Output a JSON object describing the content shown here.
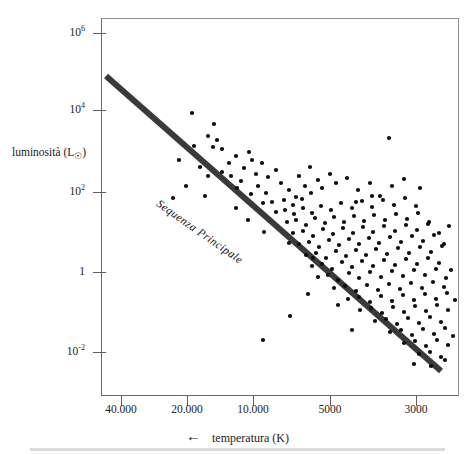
{
  "figure": {
    "kind": "hertzsprung-russell-diagram",
    "background_color": "#ffffff",
    "ink_color": "#111111"
  },
  "axes": {
    "y_title_text": "luminosità (L",
    "y_title_sun": "☉",
    "y_title_close": ")",
    "x_title": "temperatura (K)",
    "x_arrow": "←"
  },
  "annotations": {
    "main_sequence": "Sequenza Principale"
  },
  "chart_data": {
    "type": "scatter",
    "title": "",
    "xlabel": "temperatura (K)",
    "ylabel": "luminosità (L☉)",
    "xscale": "log-reversed",
    "yscale": "log",
    "xlim": [
      48000,
      2600
    ],
    "ylim": [
      0.001,
      4000000.0
    ],
    "grid": false,
    "legend": null,
    "x_ticks": [
      {
        "value": 40000,
        "label": "40.000",
        "px": 121
      },
      {
        "value": 20000,
        "label": "20.000",
        "px": 187
      },
      {
        "value": 10000,
        "label": "10.000",
        "px": 253
      },
      {
        "value": 5000,
        "label": "5000",
        "px": 330
      },
      {
        "value": 3000,
        "label": "3000",
        "px": 416
      }
    ],
    "y_ticks": [
      {
        "value": 1000000,
        "mantissa": "10",
        "exponent": "6",
        "label": "10^6",
        "px": 33
      },
      {
        "value": 10000,
        "mantissa": "10",
        "exponent": "4",
        "label": "10^4",
        "px": 110
      },
      {
        "value": 100,
        "mantissa": "10",
        "exponent": "2",
        "label": "10^2",
        "px": 192
      },
      {
        "value": 1,
        "mantissa": "1",
        "exponent": "",
        "label": "1",
        "px": 272
      },
      {
        "value": 0.01,
        "mantissa": "10",
        "exponent": "-2",
        "label": "10^-2",
        "px": 352
      }
    ],
    "main_sequence_line": {
      "label": "Sequenza Principale",
      "color": "#3a3a3a",
      "width_px": 6,
      "start_px": [
        106,
        76
      ],
      "end_px": [
        441,
        371
      ]
    },
    "points_px": [
      [
        192,
        113
      ],
      [
        214,
        124
      ],
      [
        208,
        136
      ],
      [
        217,
        140
      ],
      [
        194,
        146
      ],
      [
        213,
        147
      ],
      [
        222,
        149
      ],
      [
        179,
        160
      ],
      [
        236,
        156
      ],
      [
        229,
        163
      ],
      [
        249,
        152
      ],
      [
        252,
        160
      ],
      [
        200,
        167
      ],
      [
        244,
        168
      ],
      [
        262,
        163
      ],
      [
        222,
        172
      ],
      [
        208,
        176
      ],
      [
        231,
        176
      ],
      [
        256,
        174
      ],
      [
        241,
        181
      ],
      [
        268,
        177
      ],
      [
        276,
        170
      ],
      [
        237,
        188
      ],
      [
        258,
        186
      ],
      [
        281,
        183
      ],
      [
        299,
        176
      ],
      [
        310,
        167
      ],
      [
        389,
        138
      ],
      [
        251,
        194
      ],
      [
        266,
        193
      ],
      [
        289,
        190
      ],
      [
        296,
        197
      ],
      [
        305,
        186
      ],
      [
        318,
        180
      ],
      [
        330,
        174
      ],
      [
        263,
        203
      ],
      [
        272,
        202
      ],
      [
        284,
        200
      ],
      [
        293,
        205
      ],
      [
        302,
        199
      ],
      [
        311,
        193
      ],
      [
        322,
        188
      ],
      [
        336,
        183
      ],
      [
        347,
        178
      ],
      [
        358,
        190
      ],
      [
        370,
        183
      ],
      [
        380,
        196
      ],
      [
        392,
        186
      ],
      [
        404,
        179
      ],
      [
        276,
        212
      ],
      [
        285,
        210
      ],
      [
        294,
        214
      ],
      [
        303,
        208
      ],
      [
        312,
        213
      ],
      [
        321,
        206
      ],
      [
        331,
        210
      ],
      [
        341,
        203
      ],
      [
        352,
        208
      ],
      [
        362,
        201
      ],
      [
        372,
        207
      ],
      [
        383,
        200
      ],
      [
        394,
        205
      ],
      [
        405,
        198
      ],
      [
        416,
        206
      ],
      [
        287,
        222
      ],
      [
        296,
        220
      ],
      [
        306,
        225
      ],
      [
        315,
        218
      ],
      [
        325,
        223
      ],
      [
        334,
        217
      ],
      [
        344,
        222
      ],
      [
        354,
        216
      ],
      [
        364,
        221
      ],
      [
        374,
        215
      ],
      [
        385,
        220
      ],
      [
        396,
        214
      ],
      [
        407,
        219
      ],
      [
        418,
        213
      ],
      [
        429,
        222
      ],
      [
        293,
        233
      ],
      [
        303,
        231
      ],
      [
        313,
        236
      ],
      [
        323,
        229
      ],
      [
        333,
        234
      ],
      [
        343,
        228
      ],
      [
        353,
        233
      ],
      [
        363,
        227
      ],
      [
        373,
        232
      ],
      [
        384,
        226
      ],
      [
        395,
        231
      ],
      [
        406,
        225
      ],
      [
        417,
        230
      ],
      [
        428,
        224
      ],
      [
        439,
        233
      ],
      [
        299,
        244
      ],
      [
        309,
        242
      ],
      [
        319,
        247
      ],
      [
        329,
        240
      ],
      [
        339,
        245
      ],
      [
        349,
        239
      ],
      [
        359,
        244
      ],
      [
        369,
        238
      ],
      [
        379,
        243
      ],
      [
        390,
        237
      ],
      [
        401,
        242
      ],
      [
        412,
        236
      ],
      [
        423,
        241
      ],
      [
        434,
        235
      ],
      [
        444,
        244
      ],
      [
        306,
        255
      ],
      [
        316,
        253
      ],
      [
        326,
        258
      ],
      [
        336,
        251
      ],
      [
        346,
        256
      ],
      [
        356,
        250
      ],
      [
        366,
        255
      ],
      [
        376,
        249
      ],
      [
        387,
        254
      ],
      [
        398,
        248
      ],
      [
        409,
        253
      ],
      [
        420,
        247
      ],
      [
        431,
        252
      ],
      [
        442,
        246
      ],
      [
        312,
        266
      ],
      [
        322,
        264
      ],
      [
        332,
        269
      ],
      [
        342,
        262
      ],
      [
        352,
        267
      ],
      [
        362,
        261
      ],
      [
        373,
        266
      ],
      [
        384,
        260
      ],
      [
        395,
        265
      ],
      [
        406,
        259
      ],
      [
        417,
        264
      ],
      [
        428,
        258
      ],
      [
        439,
        263
      ],
      [
        318,
        277
      ],
      [
        328,
        275
      ],
      [
        338,
        280
      ],
      [
        349,
        273
      ],
      [
        359,
        278
      ],
      [
        370,
        272
      ],
      [
        381,
        277
      ],
      [
        392,
        271
      ],
      [
        403,
        276
      ],
      [
        414,
        270
      ],
      [
        425,
        275
      ],
      [
        436,
        269
      ],
      [
        446,
        278
      ],
      [
        334,
        288
      ],
      [
        345,
        286
      ],
      [
        356,
        291
      ],
      [
        367,
        285
      ],
      [
        378,
        290
      ],
      [
        389,
        284
      ],
      [
        400,
        289
      ],
      [
        411,
        283
      ],
      [
        422,
        288
      ],
      [
        433,
        282
      ],
      [
        444,
        287
      ],
      [
        348,
        299
      ],
      [
        359,
        297
      ],
      [
        370,
        302
      ],
      [
        381,
        296
      ],
      [
        392,
        301
      ],
      [
        403,
        295
      ],
      [
        414,
        300
      ],
      [
        425,
        294
      ],
      [
        436,
        299
      ],
      [
        447,
        293
      ],
      [
        360,
        310
      ],
      [
        371,
        308
      ],
      [
        382,
        313
      ],
      [
        393,
        307
      ],
      [
        404,
        312
      ],
      [
        415,
        306
      ],
      [
        426,
        311
      ],
      [
        437,
        305
      ],
      [
        448,
        310
      ],
      [
        375,
        321
      ],
      [
        386,
        319
      ],
      [
        397,
        324
      ],
      [
        408,
        318
      ],
      [
        419,
        323
      ],
      [
        430,
        317
      ],
      [
        441,
        322
      ],
      [
        390,
        332
      ],
      [
        401,
        330
      ],
      [
        412,
        335
      ],
      [
        423,
        329
      ],
      [
        434,
        334
      ],
      [
        445,
        328
      ],
      [
        404,
        343
      ],
      [
        415,
        341
      ],
      [
        426,
        346
      ],
      [
        437,
        340
      ],
      [
        448,
        345
      ],
      [
        419,
        354
      ],
      [
        430,
        352
      ],
      [
        441,
        357
      ],
      [
        263,
        340
      ],
      [
        290,
        316
      ],
      [
        338,
        305
      ],
      [
        308,
        294
      ],
      [
        352,
        330
      ],
      [
        414,
        364
      ],
      [
        431,
        366
      ],
      [
        445,
        360
      ],
      [
        236,
        208
      ],
      [
        248,
        220
      ],
      [
        205,
        196
      ],
      [
        186,
        186
      ],
      [
        173,
        198
      ],
      [
        264,
        232
      ],
      [
        289,
        243
      ],
      [
        313,
        258
      ],
      [
        455,
        300
      ],
      [
        451,
        270
      ],
      [
        453,
        336
      ],
      [
        449,
        226
      ],
      [
        372,
        196
      ],
      [
        356,
        202
      ],
      [
        420,
        188
      ]
    ],
    "point_color": "#0d0d0d",
    "point_size_px": 4.2
  }
}
